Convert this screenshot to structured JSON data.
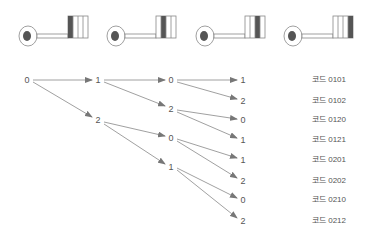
{
  "keys": [
    {
      "label": "key-1",
      "dark_bit": 0
    },
    {
      "label": "key-2",
      "dark_bit": 1
    },
    {
      "label": "key-3",
      "dark_bit": 2
    },
    {
      "label": "key-4",
      "dark_bit": 3
    }
  ],
  "colors": {
    "line": "#888888",
    "dark": "#555555",
    "text": "#555555"
  },
  "tree": {
    "root": {
      "label": "0",
      "x": 27,
      "y": 80
    },
    "level1": [
      {
        "label": "1",
        "x": 98,
        "y": 80
      },
      {
        "label": "2",
        "x": 98,
        "y": 120
      }
    ],
    "level2": [
      {
        "label": "0",
        "x": 171,
        "y": 80
      },
      {
        "label": "2",
        "x": 171,
        "y": 109
      },
      {
        "label": "0",
        "x": 171,
        "y": 138
      },
      {
        "label": "1",
        "x": 171,
        "y": 167
      }
    ],
    "level3": [
      {
        "label": "1",
        "x": 243,
        "y": 80
      },
      {
        "label": "2",
        "x": 243,
        "y": 101
      },
      {
        "label": "0",
        "x": 243,
        "y": 120
      },
      {
        "label": "1",
        "x": 243,
        "y": 140
      },
      {
        "label": "1",
        "x": 243,
        "y": 160
      },
      {
        "label": "2",
        "x": 243,
        "y": 181
      },
      {
        "label": "0",
        "x": 243,
        "y": 200
      },
      {
        "label": "2",
        "x": 243,
        "y": 221
      }
    ]
  },
  "codes": [
    "코드 0101",
    "코드 0102",
    "코드 0120",
    "코드 0121",
    "코드 0201",
    "코드 0202",
    "코드 0210",
    "코드 0212"
  ]
}
